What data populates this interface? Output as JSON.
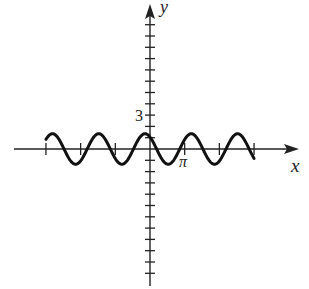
{
  "chart_data": {
    "type": "line",
    "title": "",
    "xlabel": "x",
    "ylabel": "y",
    "x_tick_labels": [
      {
        "value": 3.14159,
        "label": "π"
      }
    ],
    "y_tick_labels": [
      {
        "value": 3,
        "label": "3"
      }
    ],
    "x_tick_step": 3.14159,
    "x_ticks": [
      -9.42,
      -6.28,
      -3.14,
      3.14,
      6.28,
      9.42
    ],
    "y_tick_step": 1,
    "y_ticks_range": [
      -11,
      11
    ],
    "grid": false,
    "xlim": [
      -12.5,
      13.4
    ],
    "ylim": [
      -12,
      12.7
    ],
    "series": [
      {
        "name": "curve",
        "function": "sinusoid",
        "amplitude": 1.35,
        "period": 4.19,
        "peak_at_x": -0.45,
        "domain": [
          -9.42,
          9.42
        ],
        "color": "#111111"
      }
    ]
  },
  "labels": {
    "x_axis": "x",
    "y_axis": "y",
    "y_tick_3": "3",
    "x_tick_pi": "π"
  }
}
